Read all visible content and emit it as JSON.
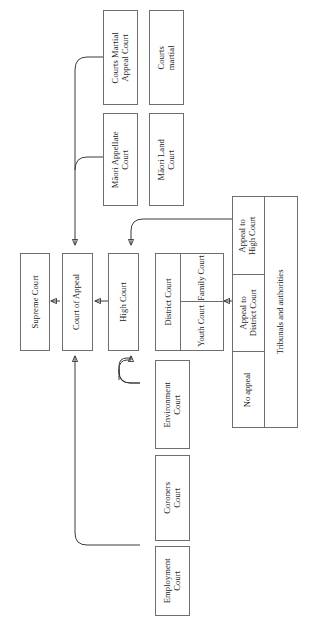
{
  "diagram": {
    "orientation": "rotated-90",
    "line_color": "#3a3a3a",
    "box_border_color": "#6e6e6e",
    "background": "#ffffff"
  },
  "nodes": {
    "supreme_court": "Supreme Court",
    "court_of_appeal": "Court of Appeal",
    "high_court": "High Court",
    "district_court": "District Court",
    "family_court": "Family Court",
    "youth_court": "Youth Court",
    "courts_martial_appeal_court": "Courts Martial\nAppeal Court",
    "courts_martial": "Courts\nmartial",
    "maori_appellate_court": "Māori Appellate\nCourt",
    "maori_land_court": "Māori Land\nCourt",
    "environment_court": "Environment\nCourt",
    "coroners_court": "Coroners\nCourt",
    "employment_court": "Employment\nCourt"
  },
  "tribunals": {
    "label": "Tribunals and authorities",
    "cells": [
      {
        "key": "appeal_to_high_court",
        "label": "Appeal to\nHigh Court"
      },
      {
        "key": "appeal_to_district_court",
        "label": "Appeal to\nDistrict Court"
      },
      {
        "key": "no_appeal",
        "label": "No appeal"
      }
    ]
  }
}
